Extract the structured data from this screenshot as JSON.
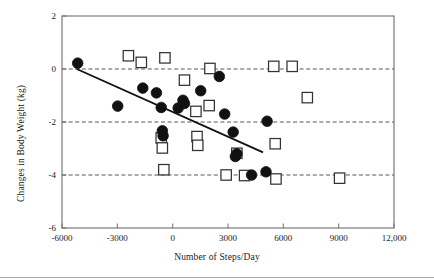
{
  "chart_data": {
    "type": "scatter",
    "title": "",
    "xlabel": "Number of Steps/Day",
    "ylabel": "Changes in Body Weight (kg)",
    "xlim": [
      -6000,
      12000
    ],
    "ylim": [
      -6,
      2
    ],
    "xticks": [
      -6000,
      -3000,
      0,
      3000,
      6000,
      9000,
      12000
    ],
    "xtick_labels": [
      "-6000",
      "-3000",
      "0",
      "3000",
      "6000",
      "9000",
      "12,000"
    ],
    "yticks": [
      2,
      0,
      -2,
      -4,
      -6
    ],
    "ytick_labels": [
      "2",
      "0",
      "-2",
      "-4",
      "-6"
    ],
    "grid": "horizontal dashed gridlines at y = 0, -2, -4",
    "gridlines": [
      0,
      -2,
      -4
    ],
    "legend": "none",
    "series": [
      {
        "name": "filled-circles",
        "marker": "circle",
        "marker_fill": "#111111",
        "marker_edge": "#111111",
        "points": [
          [
            -5150,
            0.22
          ],
          [
            -2980,
            -1.4
          ],
          [
            -1620,
            -0.72
          ],
          [
            -880,
            -0.9
          ],
          [
            -620,
            -1.45
          ],
          [
            -560,
            -2.33
          ],
          [
            -520,
            -2.52
          ],
          [
            300,
            -1.47
          ],
          [
            560,
            -1.18
          ],
          [
            640,
            -1.3
          ],
          [
            1520,
            -0.82
          ],
          [
            2530,
            -0.28
          ],
          [
            2820,
            -1.7
          ],
          [
            3280,
            -2.38
          ],
          [
            3400,
            -3.3
          ],
          [
            3480,
            -3.2
          ],
          [
            4280,
            -4.0
          ],
          [
            5060,
            -3.88
          ],
          [
            5120,
            -1.97
          ]
        ]
      },
      {
        "name": "open-squares",
        "marker": "square",
        "marker_fill": "#ffffff",
        "marker_edge": "#333333",
        "points": [
          [
            -2400,
            0.5
          ],
          [
            -1700,
            0.25
          ],
          [
            -620,
            -2.6
          ],
          [
            -560,
            -2.98
          ],
          [
            -480,
            -3.8
          ],
          [
            -420,
            0.42
          ],
          [
            640,
            -0.42
          ],
          [
            1260,
            -1.6
          ],
          [
            1320,
            -2.55
          ],
          [
            1360,
            -2.88
          ],
          [
            1980,
            -1.38
          ],
          [
            2020,
            0.02
          ],
          [
            2900,
            -4.0
          ],
          [
            3480,
            -3.18
          ],
          [
            3900,
            -4.02
          ],
          [
            5480,
            0.1
          ],
          [
            5560,
            -2.82
          ],
          [
            5600,
            -4.15
          ],
          [
            6480,
            0.1
          ],
          [
            7300,
            -1.08
          ],
          [
            9050,
            -4.12
          ]
        ]
      }
    ],
    "trendline": {
      "name": "regression-line",
      "x_start": -5200,
      "y_start": 0.0,
      "x_end": 4900,
      "y_end": -3.15,
      "color": "#111111"
    }
  }
}
